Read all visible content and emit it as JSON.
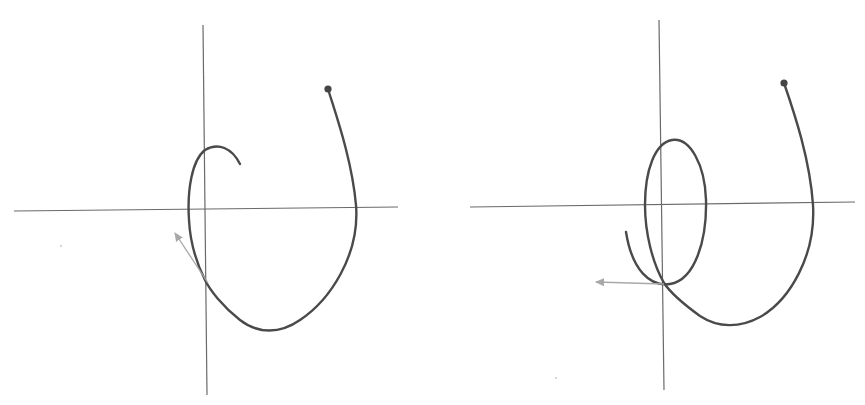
{
  "diagram": {
    "colors": {
      "background": "#ffffff",
      "axis": "#6a6a6a",
      "curve": "#4a4a4a",
      "vector": "#a8a8a8",
      "start_dot": "#444444"
    },
    "panels": [
      {
        "id": "left",
        "axes": {
          "origin": [
            205,
            210
          ],
          "x_range": [
            14,
            398
          ],
          "y_range": [
            25,
            395
          ]
        },
        "start_point": [
          328,
          89
        ],
        "curve_shape": "single loop ending in a hook near the origin",
        "vector": {
          "from": [
            208,
            283
          ],
          "to": [
            174,
            232
          ],
          "direction": "up-left"
        }
      },
      {
        "id": "right",
        "axes": {
          "origin": [
            661,
            206
          ],
          "x_range": [
            470,
            855
          ],
          "y_range": [
            20,
            390
          ]
        },
        "start_point": [
          784,
          83
        ],
        "curve_shape": "outer loop plus an inner narrow ellipse loop around origin",
        "vector": {
          "from": [
            664,
            284
          ],
          "to": [
            595,
            282
          ],
          "direction": "left"
        }
      }
    ]
  }
}
